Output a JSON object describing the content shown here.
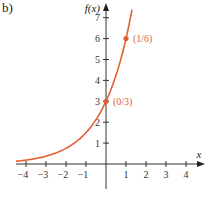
{
  "panel_label": "b)",
  "chart_data": {
    "type": "line",
    "title": "",
    "xlabel": "x",
    "ylabel": "f(x)",
    "function": "f(x) = 3 * 2^x",
    "x_ticks": [
      -4,
      -3,
      -2,
      -1,
      1,
      2,
      3,
      4
    ],
    "y_ticks": [
      1,
      2,
      3,
      4,
      5,
      6,
      7
    ],
    "xlim": [
      -4.5,
      4.8
    ],
    "ylim": [
      -1.2,
      7.6
    ],
    "grid": false,
    "series": [
      {
        "name": "f(x)",
        "color": "#e0602f",
        "x": [
          -4.5,
          -4,
          -3,
          -2,
          -1,
          0,
          0.5,
          1,
          1.3
        ],
        "values": [
          0.13,
          0.19,
          0.375,
          0.75,
          1.5,
          3,
          4.24,
          6,
          7.39
        ]
      }
    ],
    "highlighted_points": [
      {
        "x": 0,
        "y": 3,
        "label": "(0/3)"
      },
      {
        "x": 1,
        "y": 6,
        "label": "(1/6)"
      }
    ]
  }
}
